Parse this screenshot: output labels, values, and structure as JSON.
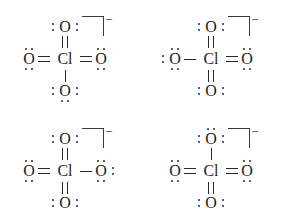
{
  "figure": {
    "ion_charge_label": "–",
    "background_color": "#ffffff",
    "ink_color": "#1c1c1c"
  },
  "structures": [
    {
      "id": "resonance-structure-1",
      "center_atom": "Cl",
      "charge": "–",
      "atoms": {
        "top": {
          "symbol": "O",
          "bond": "double",
          "lone_pairs": [
            "left",
            "right"
          ]
        },
        "bottom": {
          "symbol": "O",
          "bond": "single",
          "lone_pairs": [
            "left",
            "right",
            "bottom"
          ]
        },
        "left": {
          "symbol": "O",
          "bond": "double",
          "lone_pairs": [
            "top",
            "bottom"
          ]
        },
        "right": {
          "symbol": "O",
          "bond": "double",
          "lone_pairs": [
            "top",
            "bottom"
          ]
        }
      }
    },
    {
      "id": "resonance-structure-2",
      "center_atom": "Cl",
      "charge": "–",
      "atoms": {
        "top": {
          "symbol": "O",
          "bond": "double",
          "lone_pairs": [
            "left",
            "right"
          ]
        },
        "bottom": {
          "symbol": "O",
          "bond": "double",
          "lone_pairs": [
            "left",
            "right"
          ]
        },
        "left": {
          "symbol": "O",
          "bond": "single",
          "lone_pairs": [
            "left",
            "top",
            "bottom"
          ]
        },
        "right": {
          "symbol": "O",
          "bond": "double",
          "lone_pairs": [
            "top",
            "bottom"
          ]
        }
      }
    },
    {
      "id": "resonance-structure-3",
      "center_atom": "Cl",
      "charge": "–",
      "atoms": {
        "top": {
          "symbol": "O",
          "bond": "double",
          "lone_pairs": [
            "left",
            "right"
          ]
        },
        "bottom": {
          "symbol": "O",
          "bond": "double",
          "lone_pairs": [
            "left",
            "right"
          ]
        },
        "left": {
          "symbol": "O",
          "bond": "double",
          "lone_pairs": [
            "top",
            "bottom"
          ]
        },
        "right": {
          "symbol": "O",
          "bond": "single",
          "lone_pairs": [
            "top",
            "bottom",
            "right"
          ]
        }
      }
    },
    {
      "id": "resonance-structure-4",
      "center_atom": "Cl",
      "charge": "–",
      "atoms": {
        "top": {
          "symbol": "O",
          "bond": "single",
          "lone_pairs": [
            "top",
            "left",
            "right"
          ]
        },
        "bottom": {
          "symbol": "O",
          "bond": "double",
          "lone_pairs": [
            "left",
            "right"
          ]
        },
        "left": {
          "symbol": "O",
          "bond": "double",
          "lone_pairs": [
            "top",
            "bottom"
          ]
        },
        "right": {
          "symbol": "O",
          "bond": "double",
          "lone_pairs": [
            "top",
            "bottom"
          ]
        }
      }
    }
  ]
}
